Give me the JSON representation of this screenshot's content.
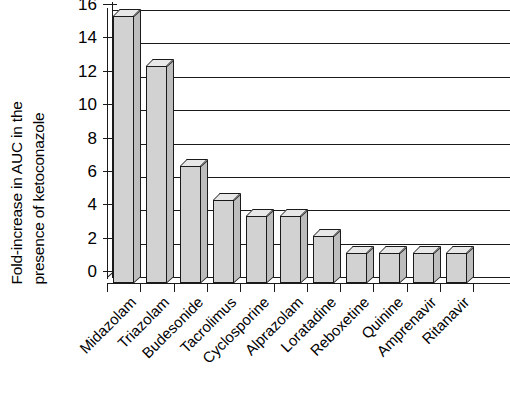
{
  "chart_data": {
    "type": "bar",
    "title": "",
    "subtitle": "",
    "xlabel": "",
    "ylabel": "Fold-increase in AUC in the presence of ketoconazole",
    "ylabel_lines": [
      "Fold-increase in AUC in the",
      "presence of ketoconazole"
    ],
    "ylim": [
      0,
      16
    ],
    "yticks": [
      0,
      2,
      4,
      6,
      8,
      10,
      12,
      14,
      16
    ],
    "ytick_labels": [
      "0",
      "2",
      "4",
      "6",
      "8",
      "10",
      "12",
      "14",
      "16"
    ],
    "grid": true,
    "grid_axis": "y",
    "legend": false,
    "legend_position": "none",
    "style": "3d-column",
    "bar_color": "#d2d2d2",
    "bar_side_color": "#bdbdbd",
    "bar_top_color": "#e8e8e8",
    "bar_edge_color": "#1a1a1a",
    "categories": [
      "Midazolam",
      "Triazolam",
      "Budesonide",
      "Tacrolimus",
      "Cyclosporine",
      "Alprazolam",
      "Loratadine",
      "Reboxetine",
      "Quinine",
      "Amprenavir",
      "Ritanavir"
    ],
    "values": [
      16,
      13,
      7,
      5,
      4,
      4,
      2.8,
      1.8,
      1.8,
      1.8,
      1.8
    ]
  }
}
